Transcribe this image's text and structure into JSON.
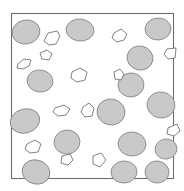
{
  "figure": {
    "canvas": {
      "width": 184,
      "height": 191,
      "background": "#ffffff"
    },
    "frame": {
      "name": "field-of-view-border",
      "x": 11,
      "y": 13,
      "width": 163,
      "height": 166,
      "stroke": "#6e6e6e",
      "stroke_width": 1.1,
      "fill": "#ffffff"
    },
    "palette": {
      "grain_fill": "#c9c9c9",
      "grain_stroke": "#8a8a8a",
      "fragment_fill": "#ffffff",
      "fragment_stroke": "#6b6b6b",
      "frame_stroke": "#6e6e6e",
      "background": "#ffffff"
    },
    "counts": {
      "grains": 19,
      "fragments": 13,
      "total_objects": 32
    },
    "grains": [
      {
        "id": "grain-01",
        "cx": 26,
        "cy": 32,
        "rx": 14,
        "ry": 12,
        "rot": -12
      },
      {
        "id": "grain-02",
        "cx": 80,
        "cy": 30,
        "rx": 14,
        "ry": 11,
        "rot": 6
      },
      {
        "id": "grain-03",
        "cx": 158,
        "cy": 29,
        "rx": 13,
        "ry": 11,
        "rot": -5
      },
      {
        "id": "grain-04",
        "cx": 140,
        "cy": 58,
        "rx": 13,
        "ry": 12,
        "rot": 14
      },
      {
        "id": "grain-05",
        "cx": 40,
        "cy": 81,
        "rx": 13,
        "ry": 11,
        "rot": 8
      },
      {
        "id": "grain-06",
        "cx": 131,
        "cy": 85,
        "rx": 13,
        "ry": 12,
        "rot": -8
      },
      {
        "id": "grain-07",
        "cx": 161,
        "cy": 105,
        "rx": 14,
        "ry": 13,
        "rot": 10
      },
      {
        "id": "grain-08",
        "cx": 25,
        "cy": 121,
        "rx": 15,
        "ry": 12,
        "rot": -16
      },
      {
        "id": "grain-09",
        "cx": 111,
        "cy": 112,
        "rx": 14,
        "ry": 13,
        "rot": 12
      },
      {
        "id": "grain-10",
        "cx": 67,
        "cy": 142,
        "rx": 13,
        "ry": 12,
        "rot": -6
      },
      {
        "id": "grain-11",
        "cx": 132,
        "cy": 144,
        "rx": 14,
        "ry": 12,
        "rot": 4
      },
      {
        "id": "grain-12",
        "cx": 166,
        "cy": 149,
        "rx": 11,
        "ry": 10,
        "rot": -10
      },
      {
        "id": "grain-13",
        "cx": 36,
        "cy": 172,
        "rx": 14,
        "ry": 12,
        "rot": 16
      },
      {
        "id": "grain-14",
        "cx": 124,
        "cy": 172,
        "rx": 13,
        "ry": 11,
        "rot": -4
      },
      {
        "id": "grain-15",
        "cx": 157,
        "cy": 172,
        "rx": 12,
        "ry": 11,
        "rot": 7
      },
      {
        "id": "grain-16",
        "cx": 121,
        "cy": 60,
        "rx": 0,
        "ry": 0,
        "rot": 0
      },
      {
        "id": "grain-17",
        "cx": 0,
        "cy": 0,
        "rx": 0,
        "ry": 0,
        "rot": 0
      },
      {
        "id": "grain-18",
        "cx": 0,
        "cy": 0,
        "rx": 0,
        "ry": 0,
        "rot": 0
      },
      {
        "id": "grain-19",
        "cx": 0,
        "cy": 0,
        "rx": 0,
        "ry": 0,
        "rot": 0
      }
    ],
    "fragments": [
      {
        "id": "fragment-01",
        "points": "44,41 48,33 57,31 60,36 56,44 49,45"
      },
      {
        "id": "fragment-02",
        "points": "18,64 24,59 31,60 29,66 23,69 17,68"
      },
      {
        "id": "fragment-03",
        "points": "114,33 121,29 127,34 124,40 117,42 112,38"
      },
      {
        "id": "fragment-04",
        "points": "167,49 176,48 175,58 168,59 164,54"
      },
      {
        "id": "fragment-05",
        "points": "72,72 80,68 87,72 85,80 77,82 71,78"
      },
      {
        "id": "fragment-06",
        "points": "114,72 120,69 124,74 121,80 115,79"
      },
      {
        "id": "fragment-07",
        "points": "55,108 64,105 70,109 66,115 58,116 53,112"
      },
      {
        "id": "fragment-08",
        "points": "83,107 89,103 94,108 92,116 85,117 81,112"
      },
      {
        "id": "fragment-09",
        "points": "168,128 177,124 180,131 174,136 167,134"
      },
      {
        "id": "fragment-10",
        "points": "27,144 35,140 41,144 38,152 30,153 25,149"
      },
      {
        "id": "fragment-11",
        "points": "62,156 70,154 73,160 68,165 61,163"
      },
      {
        "id": "fragment-12",
        "points": "93,156 101,153 106,160 100,167 93,164"
      },
      {
        "id": "fragment-13",
        "points": "40,53 47,50 52,54 49,60 42,59"
      }
    ]
  }
}
